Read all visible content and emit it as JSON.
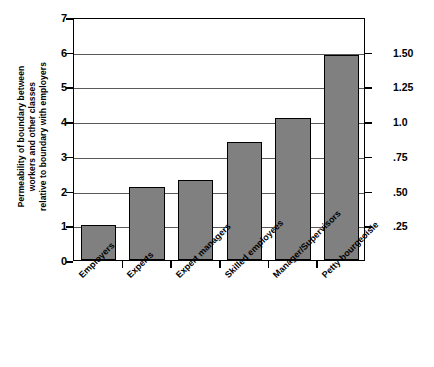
{
  "chart_data": {
    "type": "bar",
    "title": "",
    "subtitle": "",
    "categories": [
      "Employers",
      "Experts",
      "Expert managers",
      "Skilled employees",
      "Manager/Supervisors",
      "Petty bourgeoisie"
    ],
    "values": [
      1.0,
      2.1,
      2.3,
      3.4,
      4.1,
      5.9
    ],
    "xlabel": "",
    "ylabel": "Permeability of boundary between workers and other classes relative to boundary with employers",
    "ylabel_lines": [
      "Permeability of boundary between",
      "workers and other classes",
      "relative to boundary with employers"
    ],
    "ylim": [
      0,
      7
    ],
    "left_axis": {
      "ticks": [
        0,
        1,
        2,
        3,
        4,
        5,
        6,
        7
      ],
      "tick_labels": [
        "0",
        "1",
        "2",
        "3",
        "4",
        "5",
        "6",
        "7"
      ]
    },
    "right_axis": {
      "tick_labels": [
        "1.50",
        "1.25",
        "1.0",
        ".75",
        ".50",
        ".25"
      ],
      "tick_values": [
        1.5,
        1.25,
        1.0,
        0.75,
        0.5,
        0.25
      ],
      "ylim": [
        0,
        1.75
      ]
    },
    "grid": true,
    "grid_axis": "y",
    "legend": false,
    "colors": {
      "bar_fill": "#808080",
      "bar_border": "#000000",
      "axis": "#000000",
      "gridline": "#5a5a5a",
      "background": "#ffffff",
      "text": "#000000"
    }
  }
}
